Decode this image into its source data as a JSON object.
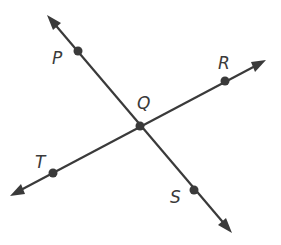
{
  "diagram": {
    "type": "intersecting-lines",
    "lines": [
      {
        "name": "line PS",
        "through": [
          "P",
          "Q",
          "S"
        ],
        "start": [
          47,
          15
        ],
        "end": [
          232,
          233
        ]
      },
      {
        "name": "line TR",
        "through": [
          "T",
          "Q",
          "R"
        ],
        "start": [
          10,
          196
        ],
        "end": [
          266,
          60
        ]
      }
    ],
    "points": [
      {
        "id": "P",
        "label": "P",
        "x": 78,
        "y": 51,
        "label_x": 52,
        "label_y": 64
      },
      {
        "id": "Q",
        "label": "Q",
        "x": 140,
        "y": 126,
        "label_x": 137,
        "label_y": 109
      },
      {
        "id": "R",
        "label": "R",
        "x": 225,
        "y": 81,
        "label_x": 218,
        "label_y": 69
      },
      {
        "id": "T",
        "label": "T",
        "x": 53,
        "y": 173,
        "label_x": 35,
        "label_y": 168
      },
      {
        "id": "S",
        "label": "S",
        "x": 194,
        "y": 190,
        "label_x": 170,
        "label_y": 203
      }
    ],
    "colors": {
      "stroke": "#3a3a3a",
      "background": "#ffffff"
    }
  }
}
